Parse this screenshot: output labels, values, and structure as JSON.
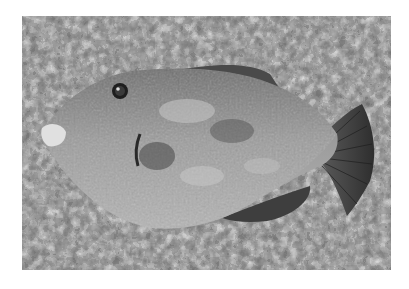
{
  "image": {
    "subject": "triggerfish lying on speckled granite surface",
    "style": "grayscale photograph",
    "colors": {
      "background": "#ffffff",
      "stone_light": "#c8c8c8",
      "stone_dark": "#3a3a3a",
      "fish_body": "#9a9a9a",
      "fish_dark": "#4a4a4a"
    }
  }
}
